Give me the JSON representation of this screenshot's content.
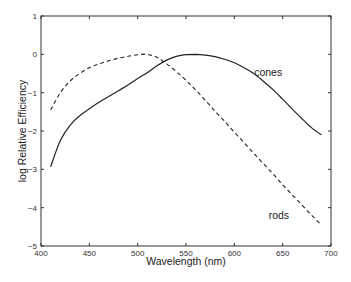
{
  "chart_data": {
    "type": "line",
    "title": "",
    "xlabel": "Wavelength (nm)",
    "ylabel": "log Relative Efficiency",
    "xlim": [
      400,
      700
    ],
    "ylim": [
      -5,
      1
    ],
    "xticks": [
      400,
      450,
      500,
      550,
      600,
      650,
      700
    ],
    "yticks": [
      -5,
      -4,
      -3,
      -2,
      -1,
      0,
      1
    ],
    "grid": false,
    "legend": null,
    "series": [
      {
        "name": "cones",
        "style": "solid",
        "x": [
          410,
          420,
          430,
          440,
          450,
          460,
          470,
          480,
          490,
          500,
          510,
          520,
          530,
          540,
          550,
          560,
          570,
          580,
          590,
          600,
          610,
          620,
          630,
          640,
          650,
          660,
          670,
          680,
          690
        ],
        "y": [
          -2.93,
          -2.25,
          -1.85,
          -1.6,
          -1.42,
          -1.25,
          -1.1,
          -0.95,
          -0.8,
          -0.63,
          -0.48,
          -0.3,
          -0.15,
          -0.05,
          -0.01,
          0.0,
          -0.02,
          -0.06,
          -0.13,
          -0.22,
          -0.35,
          -0.5,
          -0.7,
          -0.92,
          -1.17,
          -1.43,
          -1.68,
          -1.92,
          -2.1
        ]
      },
      {
        "name": "rods",
        "style": "dashed",
        "x": [
          410,
          420,
          430,
          440,
          450,
          460,
          470,
          480,
          490,
          500,
          510,
          520,
          530,
          540,
          550,
          560,
          570,
          580,
          590,
          600,
          610,
          620,
          630,
          640,
          650,
          660,
          670,
          680,
          690
        ],
        "y": [
          -1.45,
          -1.0,
          -0.7,
          -0.5,
          -0.35,
          -0.25,
          -0.17,
          -0.1,
          -0.05,
          -0.01,
          0.0,
          -0.08,
          -0.25,
          -0.45,
          -0.68,
          -0.93,
          -1.2,
          -1.48,
          -1.75,
          -2.03,
          -2.3,
          -2.58,
          -2.85,
          -3.12,
          -3.4,
          -3.67,
          -3.93,
          -4.2,
          -4.45
        ]
      }
    ],
    "annotations": [
      {
        "text": "cones",
        "x": 635,
        "y": -0.45
      },
      {
        "text": "rods",
        "x": 650,
        "y": -4.2
      }
    ]
  }
}
